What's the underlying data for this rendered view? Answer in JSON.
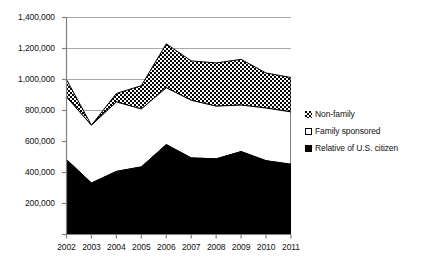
{
  "chart_data": {
    "type": "area",
    "stacked": true,
    "title": "",
    "subtitle": "",
    "xlabel": "",
    "ylabel": "",
    "categories": [
      "2002",
      "2003",
      "2004",
      "2005",
      "2006",
      "2007",
      "2008",
      "2009",
      "2010",
      "2011"
    ],
    "x_tick_labels": [
      "2002",
      "2003",
      "2004",
      "2005",
      "2006",
      "2007",
      "2008",
      "2009",
      "2010",
      "2011"
    ],
    "y_tick_labels": [
      "0",
      "200,000",
      "400,000",
      "600,000",
      "800,000",
      "1,000,000",
      "1,200,000",
      "1,400,000"
    ],
    "y_tick_values": [
      0,
      200000,
      400000,
      600000,
      800000,
      1000000,
      1200000,
      1400000
    ],
    "ylim": [
      0,
      1400000
    ],
    "grid": true,
    "grid_axis": "y",
    "legend_position": "right",
    "series": [
      {
        "name": "Relative of U.S. citizen",
        "marker": "black-square",
        "color": "#000000",
        "values": [
          483000,
          332000,
          407000,
          436000,
          580000,
          494000,
          488000,
          535000,
          476000,
          453000
        ]
      },
      {
        "name": "Family sponsored",
        "marker": "white-square",
        "color": "#ffffff",
        "values": [
          404000,
          373000,
          448000,
          374000,
          367000,
          372000,
          340000,
          300000,
          340000,
          338000
        ]
      },
      {
        "name": "Non-family",
        "marker": "hatched-square",
        "color": "#000000",
        "values": [
          113000,
          0,
          55000,
          150000,
          283000,
          254000,
          279000,
          295000,
          226000,
          222000
        ]
      }
    ],
    "totals": [
      1000000,
      705000,
      910000,
      960000,
      1230000,
      1120000,
      1107000,
      1130000,
      1042000,
      1013000
    ]
  },
  "legend": {
    "items": [
      {
        "label": "Non-family",
        "swatch": "hatched-square-icon"
      },
      {
        "label": "Family sponsored",
        "swatch": "white-square-icon"
      },
      {
        "label": "Relative of U.S. citizen",
        "swatch": "black-square-icon"
      }
    ]
  },
  "colors": {
    "axis": "#808080",
    "grid": "#a8a8a8",
    "text": "#111111",
    "series_black": "#000000",
    "series_white": "#ffffff"
  }
}
